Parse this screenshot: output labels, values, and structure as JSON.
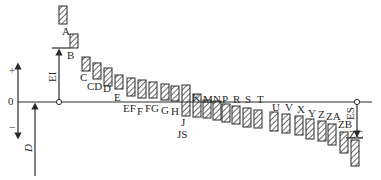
{
  "diagram": {
    "axis": {
      "plus_label": "+",
      "zero_label": "0",
      "minus_label": "−",
      "ei_label": "EI",
      "es_label": "ES",
      "d_label": "D"
    },
    "zones": [
      {
        "name": "A",
        "x": 59,
        "top": 6,
        "bottom": 24,
        "lx": 62,
        "ly": 35
      },
      {
        "name": "B",
        "x": 70,
        "top": 34,
        "bottom": 48,
        "lx": 67,
        "ly": 59
      },
      {
        "name": "C",
        "x": 82,
        "top": 57,
        "bottom": 71,
        "lx": 80,
        "ly": 81
      },
      {
        "name": "CD",
        "x": 93,
        "top": 63,
        "bottom": 79,
        "lx": 87,
        "ly": 90
      },
      {
        "name": "D",
        "x": 104,
        "top": 68,
        "bottom": 86,
        "lx": 103,
        "ly": 92
      },
      {
        "name": "E",
        "x": 115,
        "top": 75,
        "bottom": 89,
        "lx": 114,
        "ly": 101
      },
      {
        "name": "EF",
        "x": 127,
        "top": 78,
        "bottom": 96,
        "lx": 123,
        "ly": 112
      },
      {
        "name": "F",
        "x": 138,
        "top": 80,
        "bottom": 98,
        "lx": 137,
        "ly": 115
      },
      {
        "name": "FG",
        "x": 149,
        "top": 82,
        "bottom": 98,
        "lx": 145,
        "ly": 112
      },
      {
        "name": "G",
        "x": 161,
        "top": 84,
        "bottom": 100,
        "lx": 161,
        "ly": 114
      },
      {
        "name": "H",
        "x": 171,
        "top": 86,
        "bottom": 101,
        "lx": 171,
        "ly": 115
      },
      {
        "name": "J",
        "x": 182,
        "top": 85,
        "bottom": 116,
        "lx": 181,
        "ly": 126
      },
      {
        "name": "K",
        "x": 193,
        "top": 94,
        "bottom": 117,
        "lx": 192,
        "ly": 101
      },
      {
        "name": "M",
        "x": 203,
        "top": 100,
        "bottom": 118,
        "lx": 203,
        "ly": 103
      },
      {
        "name": "N",
        "x": 213,
        "top": 101,
        "bottom": 120,
        "lx": 213,
        "ly": 103
      },
      {
        "name": "P",
        "x": 222,
        "top": 104,
        "bottom": 122,
        "lx": 222,
        "ly": 103
      },
      {
        "name": "R",
        "x": 232,
        "top": 106,
        "bottom": 124,
        "lx": 233,
        "ly": 103
      },
      {
        "name": "S",
        "x": 243,
        "top": 108,
        "bottom": 127,
        "lx": 245,
        "ly": 103
      },
      {
        "name": "T",
        "x": 254,
        "top": 110,
        "bottom": 128,
        "lx": 257,
        "ly": 103
      },
      {
        "name": "U",
        "x": 270,
        "top": 112,
        "bottom": 131,
        "lx": 272,
        "ly": 111
      },
      {
        "name": "V",
        "x": 282,
        "top": 114,
        "bottom": 133,
        "lx": 285,
        "ly": 111
      },
      {
        "name": "X",
        "x": 295,
        "top": 116,
        "bottom": 135,
        "lx": 297,
        "ly": 113
      },
      {
        "name": "Y",
        "x": 306,
        "top": 119,
        "bottom": 139,
        "lx": 308,
        "ly": 117
      },
      {
        "name": "Z",
        "x": 318,
        "top": 121,
        "bottom": 141,
        "lx": 318,
        "ly": 118
      },
      {
        "name": "ZA",
        "x": 328,
        "top": 124,
        "bottom": 145,
        "lx": 326,
        "ly": 120
      },
      {
        "name": "ZB",
        "x": 340,
        "top": 132,
        "bottom": 153,
        "lx": 338,
        "ly": 128
      },
      {
        "name": "ZC",
        "x": 351,
        "top": 140,
        "bottom": 166,
        "lx": 349,
        "ly": 138
      }
    ],
    "js_zone": {
      "name": "JS",
      "x": 182,
      "top": 92,
      "bottom": 118,
      "lx": 177,
      "ly": 138
    }
  }
}
